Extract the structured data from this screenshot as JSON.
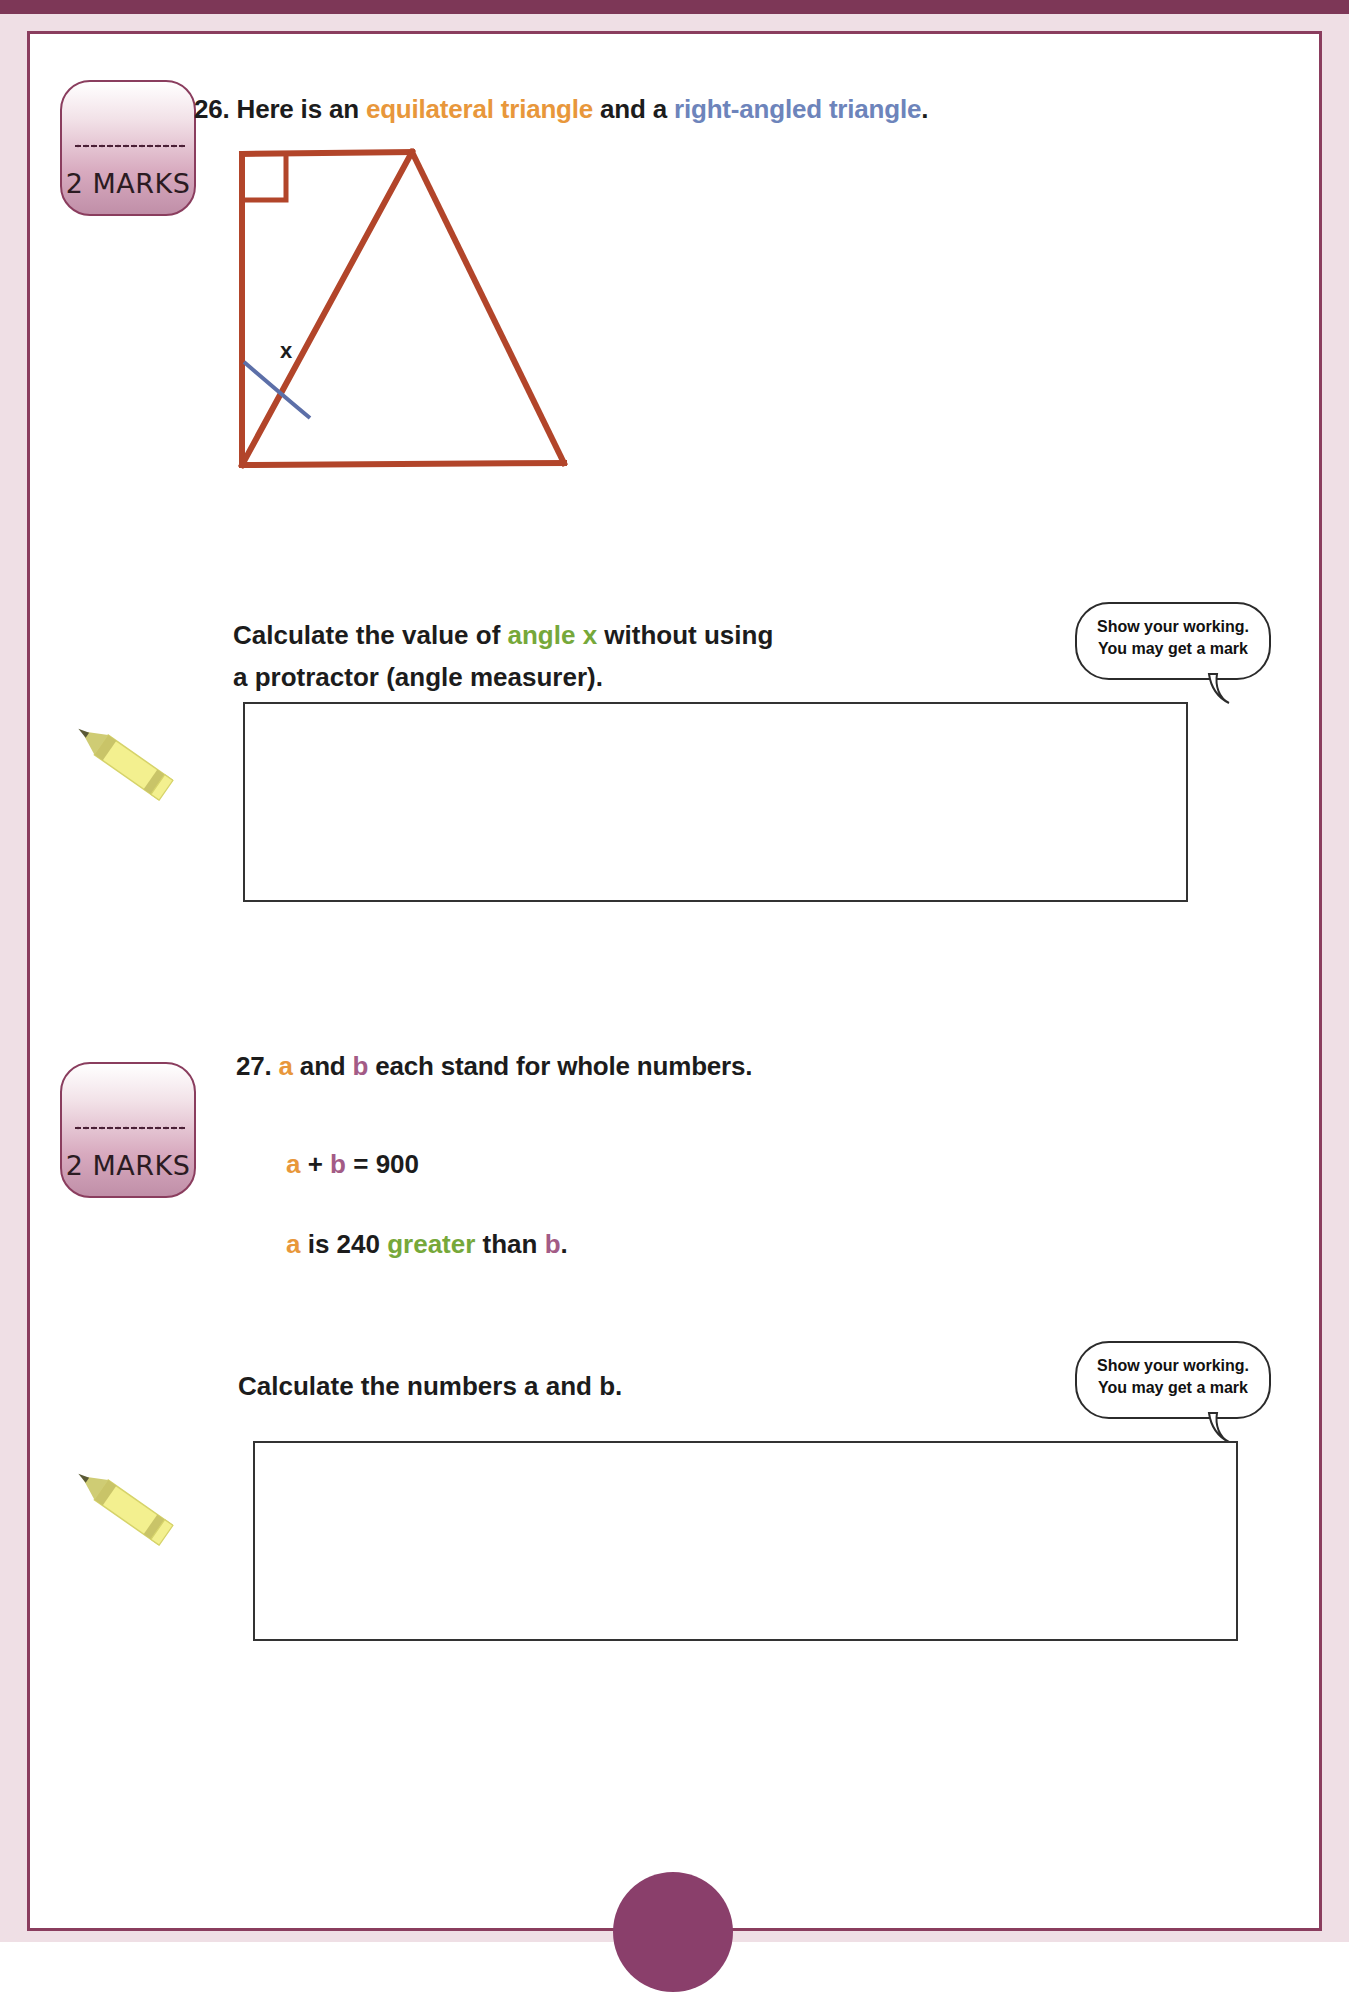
{
  "page": {
    "accent_maroon": "#8a3d5e",
    "margin_pink": "#efdfe5",
    "diagram_stroke": "#b2452a",
    "angle_arc_color": "#5c6fa8"
  },
  "questions": [
    {
      "number": "26.",
      "marks_badge": {
        "label": "2 MARKS",
        "name": "marks-badge-q26"
      },
      "heading_parts": [
        {
          "text": "26. ",
          "color": "black"
        },
        {
          "text": "Here is an ",
          "color": "black"
        },
        {
          "text": "equilateral triangle",
          "color": "orange"
        },
        {
          "text": " and a ",
          "color": "black"
        },
        {
          "text": "right-angled triangle",
          "color": "blue"
        },
        {
          "text": ".",
          "color": "black"
        }
      ],
      "heading_plain": "26. Here is an equilateral triangle and a right-angled triangle.",
      "diagram": {
        "name": "triangle-diagram",
        "angle_label": "x",
        "right_angle_marker": true,
        "shapes": [
          "right-angled-triangle",
          "equilateral-triangle"
        ]
      },
      "prompt_line1_parts": [
        {
          "text": "Calculate the value of ",
          "color": "black"
        },
        {
          "text": "angle x",
          "color": "green"
        },
        {
          "text": " without using",
          "color": "black"
        }
      ],
      "prompt_line1_plain": "Calculate the value of angle x without using",
      "prompt_line2": "a protractor (angle measurer).",
      "bubble": {
        "line1": "Show your working.",
        "line2": "You may get a mark"
      },
      "answer_box": {
        "name": "answer-box-q26",
        "value": ""
      }
    },
    {
      "number": "27.",
      "marks_badge": {
        "label": "2 MARKS",
        "name": "marks-badge-q27"
      },
      "heading_parts": [
        {
          "text": "27. ",
          "color": "black"
        },
        {
          "text": "a",
          "color": "orange"
        },
        {
          "text": " and ",
          "color": "black"
        },
        {
          "text": "b",
          "color": "plum"
        },
        {
          "text": " each stand for whole numbers.",
          "color": "black"
        }
      ],
      "heading_plain": "27. a and b each stand for whole numbers.",
      "equation_parts": [
        {
          "text": "a",
          "color": "orange"
        },
        {
          "text": " + ",
          "color": "black"
        },
        {
          "text": "b",
          "color": "plum"
        },
        {
          "text": " = 900",
          "color": "black"
        }
      ],
      "equation_plain": "a + b = 900",
      "statement_parts": [
        {
          "text": "a",
          "color": "orange"
        },
        {
          "text": " is 240 ",
          "color": "black"
        },
        {
          "text": "greater",
          "color": "green"
        },
        {
          "text": " than ",
          "color": "black"
        },
        {
          "text": "b",
          "color": "plum"
        },
        {
          "text": ".",
          "color": "black"
        }
      ],
      "statement_plain": "a is 240 greater than b.",
      "prompt_line1": "Calculate the numbers a and b.",
      "bubble": {
        "line1": "Show your working.",
        "line2": "You may get a mark"
      },
      "answer_box": {
        "name": "answer-box-q27",
        "value": ""
      }
    }
  ]
}
